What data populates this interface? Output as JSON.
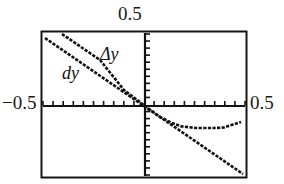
{
  "figure": {
    "title": "",
    "background_color": "#ffffff",
    "frame_color": "#141414",
    "curve_color": "#111111"
  },
  "labels": {
    "top": "0.5",
    "left": "−0.5",
    "right": "0.5",
    "delta_y": "Δy",
    "dy": "dy"
  },
  "chart_data": {
    "type": "line",
    "title": "",
    "xlabel": "",
    "ylabel": "",
    "xlim": [
      -0.5,
      0.5
    ],
    "ylim": [
      -0.5,
      0.5
    ],
    "grid": false,
    "legend": "inline-annotations",
    "axis_tick_labels": {
      "x": [
        "-0.5",
        "0.5"
      ],
      "y": [
        "0.5"
      ]
    },
    "x_tick_count": 20,
    "y_tick_count": 20,
    "annotations": [
      {
        "text": "Δy",
        "x": -0.23,
        "y": 0.29
      },
      {
        "text": "dy",
        "x": -0.33,
        "y": 0.2
      }
    ],
    "series": [
      {
        "name": "dy",
        "style": "dotted-line",
        "description": "straight line through origin with negative slope, differential approximation",
        "x": [
          -0.5,
          -0.375,
          -0.25,
          -0.125,
          0.0,
          0.125,
          0.25,
          0.375,
          0.47
        ],
        "y": [
          0.45,
          0.3375,
          0.225,
          0.1125,
          0.0,
          -0.1125,
          -0.225,
          -0.3375,
          -0.423
        ]
      },
      {
        "name": "delta-y",
        "style": "dotted-line",
        "description": "actual increment curve: follows the line for x<0, departs for x>0, flattens then rises",
        "x": [
          -0.47,
          -0.375,
          -0.25,
          -0.125,
          0.0,
          0.05,
          0.1,
          0.15,
          0.2,
          0.25,
          0.3,
          0.35,
          0.4,
          0.45,
          0.5
        ],
        "y": [
          0.492,
          0.394,
          0.264,
          0.132,
          0.0,
          -0.055,
          -0.101,
          -0.135,
          -0.155,
          -0.163,
          -0.163,
          -0.162,
          -0.155,
          -0.14,
          -0.125
        ]
      }
    ]
  }
}
